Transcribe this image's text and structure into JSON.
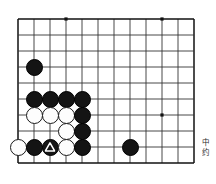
{
  "figure": {
    "kind": "go-board-diagram",
    "board": {
      "columns": 12,
      "rows": 10,
      "cell_size_px": 16,
      "origin_x_px": 4,
      "origin_y_px": 3,
      "line_color": "#333333",
      "edge_color": "#111111",
      "background_color": "#ffffff",
      "star_points": [
        {
          "col": 3,
          "row": 0
        },
        {
          "col": 9,
          "row": 0
        },
        {
          "col": 9,
          "row": 6
        }
      ]
    },
    "stones": [
      {
        "col": 1,
        "row": 3,
        "color": "black",
        "mark": ""
      },
      {
        "col": 1,
        "row": 5,
        "color": "black",
        "mark": ""
      },
      {
        "col": 2,
        "row": 5,
        "color": "black",
        "mark": ""
      },
      {
        "col": 3,
        "row": 5,
        "color": "black",
        "mark": ""
      },
      {
        "col": 4,
        "row": 5,
        "color": "black",
        "mark": ""
      },
      {
        "col": 1,
        "row": 6,
        "color": "white",
        "mark": ""
      },
      {
        "col": 2,
        "row": 6,
        "color": "white",
        "mark": ""
      },
      {
        "col": 3,
        "row": 6,
        "color": "white",
        "mark": ""
      },
      {
        "col": 4,
        "row": 6,
        "color": "black",
        "mark": ""
      },
      {
        "col": 3,
        "row": 7,
        "color": "white",
        "mark": ""
      },
      {
        "col": 4,
        "row": 7,
        "color": "black",
        "mark": ""
      },
      {
        "col": 0,
        "row": 8,
        "color": "white",
        "mark": ""
      },
      {
        "col": 1,
        "row": 8,
        "color": "black",
        "mark": ""
      },
      {
        "col": 2,
        "row": 8,
        "color": "black",
        "mark": "triangle"
      },
      {
        "col": 3,
        "row": 8,
        "color": "white",
        "mark": ""
      },
      {
        "col": 4,
        "row": 8,
        "color": "black",
        "mark": ""
      },
      {
        "col": 7,
        "row": 8,
        "color": "black",
        "mark": ""
      }
    ],
    "caption": {
      "line1": "中",
      "line2": "约"
    }
  }
}
